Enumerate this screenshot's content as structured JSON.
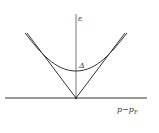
{
  "diagram": {
    "type": "dispersion-gap-diagram",
    "labels": {
      "y_axis": "ε",
      "gap": "Δ",
      "x_axis_main": "p−p",
      "x_axis_sub": "F"
    },
    "colors": {
      "line": "#333333",
      "background": "#ffffff"
    },
    "curves": [
      {
        "name": "linear-dispersion",
        "shape": "V",
        "description": "|p−pF| lines meeting at origin"
      },
      {
        "name": "gapped-dispersion",
        "shape": "hyperbola",
        "description": "sqrt(Δ² + v²(p−pF)²), minimum Δ at p=pF"
      }
    ]
  }
}
